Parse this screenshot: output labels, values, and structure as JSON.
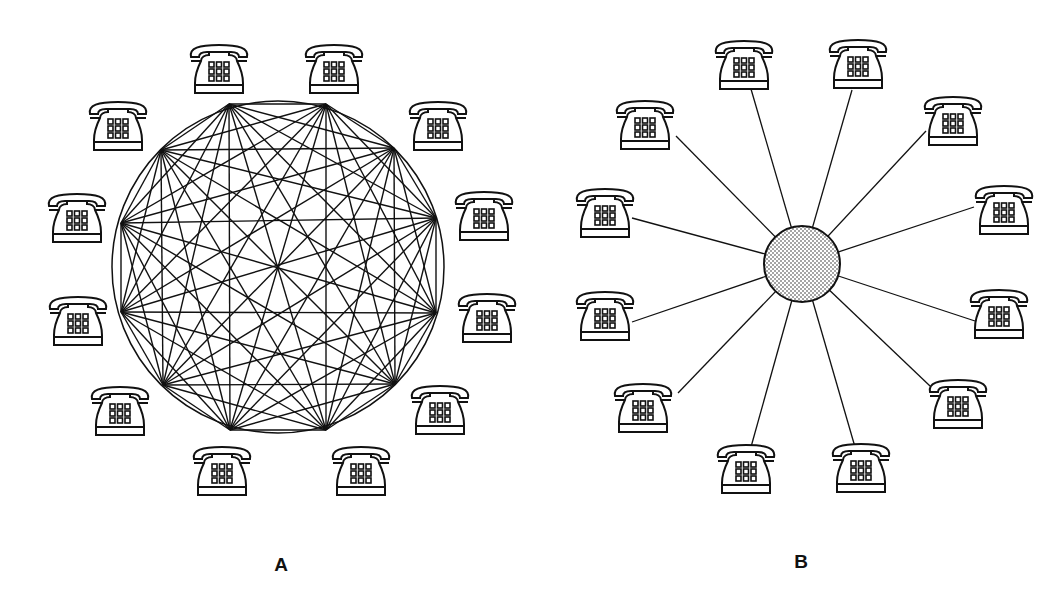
{
  "figure": {
    "panels": [
      {
        "id": "A",
        "label": "A",
        "label_pos": [
          281,
          565
        ],
        "topology": "full-mesh",
        "description": "12 telephones, each directly connected to every other telephone",
        "circle": {
          "cx": 278,
          "cy": 267,
          "r": 166
        },
        "nodes": [
          [
            229,
            104
          ],
          [
            326,
            104
          ],
          [
            394,
            148
          ],
          [
            436,
            218
          ],
          [
            436,
            313
          ],
          [
            395,
            384
          ],
          [
            326,
            430
          ],
          [
            230,
            430
          ],
          [
            163,
            385
          ],
          [
            121,
            312
          ],
          [
            121,
            223
          ],
          [
            161,
            150
          ]
        ],
        "phones": [
          [
            187,
            43
          ],
          [
            302,
            43
          ],
          [
            406,
            100
          ],
          [
            452,
            190
          ],
          [
            455,
            292
          ],
          [
            408,
            384
          ],
          [
            329,
            445
          ],
          [
            190,
            445
          ],
          [
            88,
            385
          ],
          [
            46,
            295
          ],
          [
            45,
            192
          ],
          [
            86,
            100
          ]
        ]
      },
      {
        "id": "B",
        "label": "B",
        "label_pos": [
          801,
          562
        ],
        "topology": "star",
        "description": "12 telephones, each connected to a central switch (shaded hub)",
        "hub": {
          "cx": 802,
          "cy": 264,
          "r": 38,
          "fill_pattern": "stipple"
        },
        "phones": [
          [
            712,
            39
          ],
          [
            826,
            38
          ],
          [
            921,
            95
          ],
          [
            972,
            184
          ],
          [
            967,
            288
          ],
          [
            926,
            378
          ],
          [
            829,
            442
          ],
          [
            714,
            443
          ],
          [
            611,
            382
          ],
          [
            573,
            290
          ],
          [
            573,
            187
          ],
          [
            613,
            99
          ]
        ],
        "spoke_ends": [
          [
            751,
            89
          ],
          [
            852,
            90
          ],
          [
            926,
            131
          ],
          [
            974,
            207
          ],
          [
            975,
            321
          ],
          [
            930,
            386
          ],
          [
            855,
            447
          ],
          [
            751,
            447
          ],
          [
            678,
            393
          ],
          [
            632,
            322
          ],
          [
            632,
            218
          ],
          [
            676,
            136
          ]
        ]
      }
    ],
    "phone_count_per_panel": 12,
    "line_color": "#111111",
    "background": "#ffffff"
  }
}
